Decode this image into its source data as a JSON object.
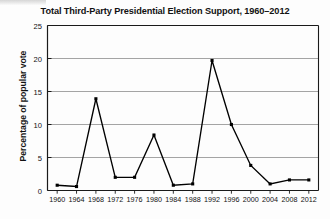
{
  "chart_data": {
    "type": "line",
    "title": "Total Third-Party Presidential Election Support, 1960–2012",
    "xlabel": "",
    "ylabel": "Percentage of popular vote",
    "categories": [
      "1960",
      "1964",
      "1968",
      "1972",
      "1976",
      "1980",
      "1984",
      "1988",
      "1992",
      "1996",
      "2000",
      "2004",
      "2008",
      "2012"
    ],
    "values": [
      0.8,
      0.6,
      13.9,
      2.0,
      2.0,
      8.4,
      0.8,
      1.0,
      19.7,
      10.0,
      3.8,
      1.0,
      1.6,
      1.6
    ],
    "series": [
      {
        "name": "Third-party share of popular vote",
        "values": [
          0.8,
          0.6,
          13.9,
          2.0,
          2.0,
          8.4,
          0.8,
          1.0,
          19.7,
          10.0,
          3.8,
          1.0,
          1.6,
          1.6
        ]
      }
    ],
    "ylim": [
      0,
      25
    ],
    "yticks": [
      0,
      5,
      10,
      15,
      20,
      25
    ],
    "ytick_labels": [
      "0",
      "5",
      "10",
      "15",
      "20",
      "25"
    ],
    "grid": "horizontal",
    "legend": "none",
    "marker": "square",
    "line_color": "#000000",
    "marker_color": "#000000",
    "grid_color": "#9a9a9a",
    "axis_color": "#1a1a1a",
    "background_color": "#fdfdfd"
  }
}
